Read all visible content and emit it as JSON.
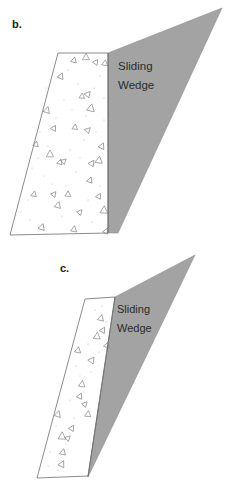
{
  "document": {
    "title": "Sliding Wedge Failure Diagrams",
    "background_color": "#ffffff",
    "width": 231,
    "height": 488
  },
  "palette": {
    "wedge_fill": "#a3a3a3",
    "wedge_stroke": "#8f8f8f",
    "block_fill": "#ffffff",
    "block_stroke": "#6e6e6e",
    "text_color": "#2b2b2b",
    "label_color": "#1a1a1a",
    "speckle_color": "#b9b9b9",
    "triangle_stroke": "#8a8a8a"
  },
  "panels": [
    {
      "id": "panel-b",
      "label": "b.",
      "label_pos": {
        "x": 12,
        "y": 28
      },
      "wedge_text": {
        "line1": "Sliding",
        "line2": "Wedge"
      },
      "wedge_text_pos": {
        "x": 118,
        "y": 70,
        "line_gap": 19
      },
      "block_points": "58,53 108,53 108,233 10,235",
      "wedge_points": "108,53 222,8 118,233 108,233",
      "inner_divider": "108,53 108,233"
    },
    {
      "id": "panel-c",
      "label": "c.",
      "label_pos": {
        "x": 60,
        "y": 272
      },
      "wedge_text": {
        "line1": "Sliding",
        "line2": "Wedge"
      },
      "wedge_text_pos": {
        "x": 117,
        "y": 313,
        "line_gap": 19
      },
      "block_points": "85,299 115,297 88,476 37,478",
      "wedge_points": "115,297 195,255 88,477 102,384",
      "inner_divider": "115,297 88,477"
    }
  ],
  "fill_markers": {
    "description": "scattered open triangles and fine speckles representing granular backfill",
    "panel_b_triangles": [
      {
        "x": 74,
        "y": 60,
        "s": 3.2,
        "r": 14
      },
      {
        "x": 86,
        "y": 57,
        "s": 3.8,
        "r": 0
      },
      {
        "x": 96,
        "y": 62,
        "s": 3.0,
        "r": 35
      },
      {
        "x": 105,
        "y": 63,
        "s": 3.2,
        "r": 8
      },
      {
        "x": 61,
        "y": 76,
        "s": 3.4,
        "r": 22
      },
      {
        "x": 82,
        "y": 96,
        "s": 3.0,
        "r": 5
      },
      {
        "x": 88,
        "y": 94,
        "s": 3.4,
        "r": 40
      },
      {
        "x": 91,
        "y": 108,
        "s": 4.2,
        "r": 12
      },
      {
        "x": 47,
        "y": 110,
        "s": 3.6,
        "r": 18
      },
      {
        "x": 54,
        "y": 128,
        "s": 3.2,
        "r": 30
      },
      {
        "x": 75,
        "y": 127,
        "s": 3.0,
        "r": 6
      },
      {
        "x": 88,
        "y": 130,
        "s": 3.2,
        "r": 45
      },
      {
        "x": 36,
        "y": 144,
        "s": 3.0,
        "r": 10
      },
      {
        "x": 102,
        "y": 146,
        "s": 3.4,
        "r": 25
      },
      {
        "x": 50,
        "y": 154,
        "s": 4.0,
        "r": 0
      },
      {
        "x": 60,
        "y": 162,
        "s": 3.0,
        "r": 16
      },
      {
        "x": 64,
        "y": 161,
        "s": 3.0,
        "r": 48
      },
      {
        "x": 92,
        "y": 163,
        "s": 3.4,
        "r": 33
      },
      {
        "x": 99,
        "y": 160,
        "s": 4.0,
        "r": 7
      },
      {
        "x": 90,
        "y": 180,
        "s": 3.2,
        "r": 20
      },
      {
        "x": 34,
        "y": 194,
        "s": 3.2,
        "r": 12
      },
      {
        "x": 54,
        "y": 194,
        "s": 3.0,
        "r": 38
      },
      {
        "x": 68,
        "y": 194,
        "s": 3.2,
        "r": 5
      },
      {
        "x": 99,
        "y": 196,
        "s": 3.0,
        "r": 28
      },
      {
        "x": 58,
        "y": 205,
        "s": 3.6,
        "r": 15
      },
      {
        "x": 104,
        "y": 210,
        "s": 4.2,
        "r": 3
      },
      {
        "x": 80,
        "y": 212,
        "s": 3.0,
        "r": 42
      },
      {
        "x": 42,
        "y": 227,
        "s": 3.6,
        "r": 20
      },
      {
        "x": 74,
        "y": 229,
        "s": 3.4,
        "r": 9
      },
      {
        "x": 106,
        "y": 231,
        "s": 3.0,
        "r": 26
      }
    ],
    "panel_c_triangles": [
      {
        "x": 101,
        "y": 318,
        "s": 3.4,
        "r": 14
      },
      {
        "x": 103,
        "y": 330,
        "s": 3.2,
        "r": 30
      },
      {
        "x": 97,
        "y": 336,
        "s": 3.8,
        "r": 6
      },
      {
        "x": 107,
        "y": 345,
        "s": 3.2,
        "r": 20
      },
      {
        "x": 78,
        "y": 350,
        "s": 3.4,
        "r": 11
      },
      {
        "x": 92,
        "y": 360,
        "s": 3.6,
        "r": 36
      },
      {
        "x": 82,
        "y": 384,
        "s": 3.6,
        "r": 8
      },
      {
        "x": 80,
        "y": 396,
        "s": 3.2,
        "r": 24
      },
      {
        "x": 85,
        "y": 404,
        "s": 3.0,
        "r": 42
      },
      {
        "x": 88,
        "y": 414,
        "s": 3.4,
        "r": 5
      },
      {
        "x": 58,
        "y": 414,
        "s": 3.6,
        "r": 18
      },
      {
        "x": 72,
        "y": 428,
        "s": 3.2,
        "r": 32
      },
      {
        "x": 62,
        "y": 436,
        "s": 4.2,
        "r": 2
      },
      {
        "x": 68,
        "y": 438,
        "s": 3.0,
        "r": 46
      },
      {
        "x": 63,
        "y": 452,
        "s": 3.4,
        "r": 13
      },
      {
        "x": 62,
        "y": 464,
        "s": 3.6,
        "r": 27
      }
    ],
    "panel_b_speckles": [
      {
        "x": 40,
        "y": 132
      },
      {
        "x": 46,
        "y": 88
      },
      {
        "x": 68,
        "y": 70
      },
      {
        "x": 78,
        "y": 84
      },
      {
        "x": 100,
        "y": 76
      },
      {
        "x": 64,
        "y": 100
      },
      {
        "x": 32,
        "y": 168
      },
      {
        "x": 44,
        "y": 176
      },
      {
        "x": 70,
        "y": 150
      },
      {
        "x": 84,
        "y": 140
      },
      {
        "x": 104,
        "y": 120
      },
      {
        "x": 96,
        "y": 132
      },
      {
        "x": 28,
        "y": 200
      },
      {
        "x": 52,
        "y": 184
      },
      {
        "x": 76,
        "y": 172
      },
      {
        "x": 88,
        "y": 200
      },
      {
        "x": 100,
        "y": 186
      },
      {
        "x": 62,
        "y": 216
      },
      {
        "x": 30,
        "y": 220
      },
      {
        "x": 92,
        "y": 222
      },
      {
        "x": 56,
        "y": 118
      },
      {
        "x": 72,
        "y": 110
      },
      {
        "x": 86,
        "y": 116
      },
      {
        "x": 48,
        "y": 146
      },
      {
        "x": 38,
        "y": 158
      },
      {
        "x": 104,
        "y": 98
      },
      {
        "x": 94,
        "y": 88
      },
      {
        "x": 66,
        "y": 186
      },
      {
        "x": 80,
        "y": 158
      },
      {
        "x": 20,
        "y": 212
      }
    ],
    "panel_c_speckles": [
      {
        "x": 95,
        "y": 310
      },
      {
        "x": 106,
        "y": 322
      },
      {
        "x": 99,
        "y": 352
      },
      {
        "x": 88,
        "y": 344
      },
      {
        "x": 91,
        "y": 372
      },
      {
        "x": 76,
        "y": 366
      },
      {
        "x": 84,
        "y": 392
      },
      {
        "x": 70,
        "y": 400
      },
      {
        "x": 74,
        "y": 418
      },
      {
        "x": 56,
        "y": 426
      },
      {
        "x": 66,
        "y": 444
      },
      {
        "x": 50,
        "y": 452
      },
      {
        "x": 58,
        "y": 470
      },
      {
        "x": 48,
        "y": 466
      },
      {
        "x": 80,
        "y": 376
      },
      {
        "x": 102,
        "y": 306
      }
    ]
  }
}
